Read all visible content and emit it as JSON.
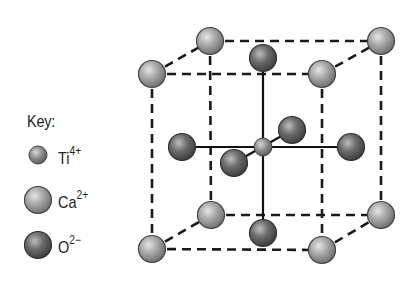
{
  "key": {
    "title": "Key:",
    "items": [
      {
        "symbol": "Ti",
        "charge": "4+",
        "color": "#8a8a8a",
        "size": "small"
      },
      {
        "symbol": "Ca",
        "charge": "2+",
        "color": "#a0a0a0",
        "size": "large"
      },
      {
        "symbol": "O",
        "charge": "2−",
        "color": "#5e5e5e",
        "size": "large"
      }
    ]
  },
  "atoms": {
    "Ca": [
      {
        "pos": "front-top-left",
        "x": 152,
        "y": 74
      },
      {
        "pos": "back-top-left",
        "x": 210,
        "y": 41
      },
      {
        "pos": "front-top-right",
        "x": 322,
        "y": 74
      },
      {
        "pos": "back-top-right",
        "x": 381,
        "y": 41
      },
      {
        "pos": "front-bottom-left",
        "x": 152,
        "y": 249
      },
      {
        "pos": "back-bottom-left",
        "x": 211,
        "y": 215
      },
      {
        "pos": "front-bottom-right",
        "x": 322,
        "y": 250
      },
      {
        "pos": "back-bottom-right",
        "x": 381,
        "y": 215
      }
    ],
    "O": [
      {
        "pos": "top",
        "x": 263,
        "y": 58
      },
      {
        "pos": "bottom",
        "x": 263,
        "y": 233
      },
      {
        "pos": "left",
        "x": 182,
        "y": 147
      },
      {
        "pos": "right",
        "x": 351,
        "y": 147
      },
      {
        "pos": "back",
        "x": 292,
        "y": 130
      },
      {
        "pos": "front",
        "x": 234,
        "y": 163
      }
    ],
    "Ti": [
      {
        "pos": "center",
        "x": 263,
        "y": 147
      }
    ]
  }
}
